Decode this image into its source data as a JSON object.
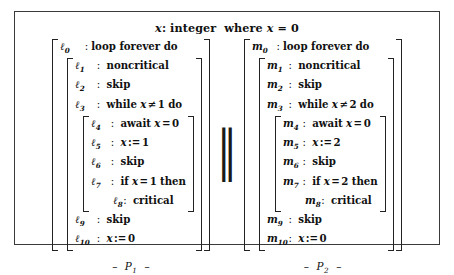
{
  "figure": {
    "declaration": {
      "variable": "x",
      "colon": ":",
      "type_keyword": "integer",
      "where_keyword": "where",
      "init_var": "x",
      "equals": "=",
      "init_value": "0"
    },
    "parallel_operator": "‖",
    "processes": [
      {
        "name": "P",
        "index": "1",
        "caption_dash_left": "–",
        "caption_dash_right": "–",
        "lines": [
          {
            "label": "ℓ",
            "sub": "0",
            "text": "loop forever do",
            "kind": "keyword",
            "level": 0
          },
          {
            "label": "ℓ",
            "sub": "1",
            "text": "noncritical",
            "kind": "keyword",
            "level": 1
          },
          {
            "label": "ℓ",
            "sub": "2",
            "text": "skip",
            "kind": "keyword",
            "level": 1
          },
          {
            "label": "ℓ",
            "sub": "3",
            "text": "while",
            "expr_var": "x",
            "expr_op": "≠",
            "expr_num": "1",
            "tail": "do",
            "kind": "while",
            "level": 1
          },
          {
            "label": "ℓ",
            "sub": "4",
            "text": "await",
            "expr_var": "x",
            "expr_op": "=",
            "expr_num": "0",
            "kind": "await",
            "level": 2
          },
          {
            "label": "ℓ",
            "sub": "5",
            "expr_var": "x",
            "expr_op": ":=",
            "expr_num": "1",
            "kind": "assign",
            "level": 2
          },
          {
            "label": "ℓ",
            "sub": "6",
            "text": "skip",
            "kind": "keyword",
            "level": 2
          },
          {
            "label": "ℓ",
            "sub": "7",
            "text": "if",
            "expr_var": "x",
            "expr_op": "=",
            "expr_num": "1",
            "tail": "then",
            "kind": "if",
            "level": 2
          },
          {
            "label": "ℓ",
            "sub": "8",
            "text": "critical",
            "kind": "keyword",
            "level": 3
          },
          {
            "label": "ℓ",
            "sub": "9",
            "text": "skip",
            "kind": "keyword",
            "level": 1
          },
          {
            "label": "ℓ",
            "sub": "10",
            "expr_var": "x",
            "expr_op": ":=",
            "expr_num": "0",
            "kind": "assign",
            "level": 1
          }
        ]
      },
      {
        "name": "P",
        "index": "2",
        "caption_dash_left": "–",
        "caption_dash_right": "–",
        "lines": [
          {
            "label": "m",
            "sub": "0",
            "text": "loop forever do",
            "kind": "keyword",
            "level": 0
          },
          {
            "label": "m",
            "sub": "1",
            "text": "noncritical",
            "kind": "keyword",
            "level": 1
          },
          {
            "label": "m",
            "sub": "2",
            "text": "skip",
            "kind": "keyword",
            "level": 1
          },
          {
            "label": "m",
            "sub": "3",
            "text": "while",
            "expr_var": "x",
            "expr_op": "≠",
            "expr_num": "2",
            "tail": "do",
            "kind": "while",
            "level": 1
          },
          {
            "label": "m",
            "sub": "4",
            "text": "await",
            "expr_var": "x",
            "expr_op": "=",
            "expr_num": "0",
            "kind": "await",
            "level": 2
          },
          {
            "label": "m",
            "sub": "5",
            "expr_var": "x",
            "expr_op": ":=",
            "expr_num": "2",
            "kind": "assign",
            "level": 2
          },
          {
            "label": "m",
            "sub": "6",
            "text": "skip",
            "kind": "keyword",
            "level": 2
          },
          {
            "label": "m",
            "sub": "7",
            "text": "if",
            "expr_var": "x",
            "expr_op": "=",
            "expr_num": "2",
            "tail": "then",
            "kind": "if",
            "level": 2
          },
          {
            "label": "m",
            "sub": "8",
            "text": "critical",
            "kind": "keyword",
            "level": 3
          },
          {
            "label": "m",
            "sub": "9",
            "text": "skip",
            "kind": "keyword",
            "level": 1
          },
          {
            "label": "m",
            "sub": "10",
            "expr_var": "x",
            "expr_op": ":=",
            "expr_num": "0",
            "kind": "assign",
            "level": 1
          }
        ]
      }
    ]
  }
}
